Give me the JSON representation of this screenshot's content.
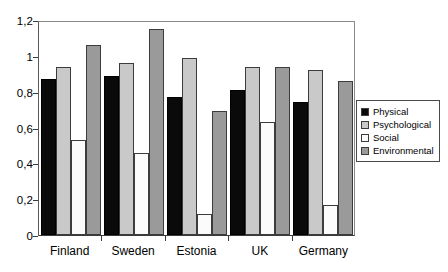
{
  "chart_data": {
    "type": "bar",
    "title": "",
    "xlabel": "",
    "ylabel": "",
    "ylim": [
      0,
      1.2
    ],
    "grid": false,
    "legend_position": "right",
    "decimal_separator": ",",
    "categories": [
      "Finland",
      "Sweden",
      "Estonia",
      "UK",
      "Germany"
    ],
    "ytick_labels": [
      "0",
      "0,2",
      "0,4",
      "0,6",
      "0,8",
      "1",
      "1,2"
    ],
    "ytick_values": [
      0,
      0.2,
      0.4,
      0.6,
      0.8,
      1,
      1.2
    ],
    "series": [
      {
        "name": "Physical",
        "color": "#0a0a0a",
        "values": [
          0.87,
          0.89,
          0.77,
          0.81,
          0.74
        ]
      },
      {
        "name": "Psychological",
        "color": "#c9c9c9",
        "values": [
          0.94,
          0.96,
          0.99,
          0.94,
          0.92
        ]
      },
      {
        "name": "Social",
        "color": "#fbfbfb",
        "values": [
          0.53,
          0.46,
          0.12,
          0.63,
          0.17
        ]
      },
      {
        "name": "Environmental",
        "color": "#9a9a9a",
        "values": [
          1.06,
          1.15,
          0.69,
          0.94,
          0.86
        ]
      }
    ]
  }
}
